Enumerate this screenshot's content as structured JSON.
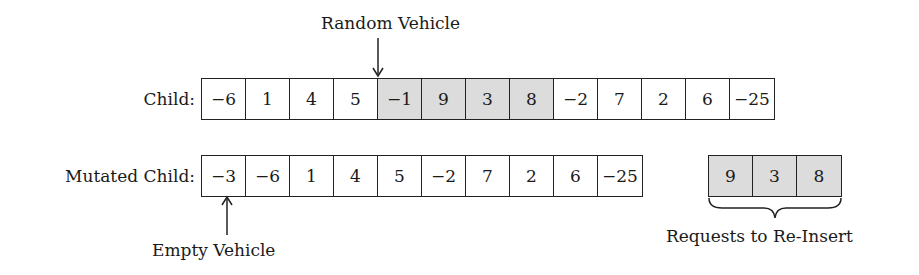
{
  "annotations": {
    "random_vehicle": "Random Vehicle",
    "empty_vehicle": "Empty Vehicle",
    "requests_to_reinsert": "Requests to Re-Insert"
  },
  "child": {
    "label": "Child:",
    "cells": [
      {
        "value": "−6",
        "highlighted": false
      },
      {
        "value": "1",
        "highlighted": false
      },
      {
        "value": "4",
        "highlighted": false
      },
      {
        "value": "5",
        "highlighted": false
      },
      {
        "value": "−1",
        "highlighted": true
      },
      {
        "value": "9",
        "highlighted": true
      },
      {
        "value": "3",
        "highlighted": true
      },
      {
        "value": "8",
        "highlighted": true
      },
      {
        "value": "−2",
        "highlighted": false
      },
      {
        "value": "7",
        "highlighted": false
      },
      {
        "value": "2",
        "highlighted": false
      },
      {
        "value": "6",
        "highlighted": false
      },
      {
        "value": "−25",
        "highlighted": false
      }
    ]
  },
  "mutated_child": {
    "label": "Mutated Child:",
    "cells": [
      {
        "value": "−3"
      },
      {
        "value": "−6"
      },
      {
        "value": "1"
      },
      {
        "value": "4"
      },
      {
        "value": "5"
      },
      {
        "value": "−2"
      },
      {
        "value": "7"
      },
      {
        "value": "2"
      },
      {
        "value": "6"
      },
      {
        "value": "−25"
      }
    ]
  },
  "reinsert": {
    "cells": [
      {
        "value": "9"
      },
      {
        "value": "3"
      },
      {
        "value": "8"
      }
    ]
  },
  "colors": {
    "highlight": "#dcdcdc",
    "border": "#222222"
  }
}
